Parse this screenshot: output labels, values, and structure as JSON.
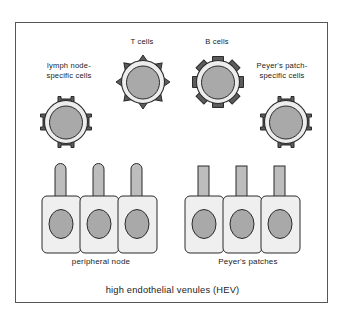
{
  "figure": {
    "title": "high endothelial venules (HEV)",
    "background": "#ffffff",
    "border_color": "#55575a"
  },
  "labels": {
    "t_cells": "T cells",
    "b_cells": "B cells",
    "lymph_node_cells": "lymph node-\nspecific cells",
    "peyers_patch_cells": "Peyer's patch-\nspecific cells",
    "peripheral_node": "peripheral node",
    "peyers_patches": "Peyer's patches",
    "caption": "high endothelial venules (HEV)"
  },
  "palette": {
    "outline": "#2b2b2b",
    "cell_rim": "#ededed",
    "nucleus": "#a9a9a9",
    "receptor_dark": "#5c5c5c",
    "venule_body": "#efefef",
    "venule_nucleus": "#a9a9a9",
    "stalk": "#bdbdbd"
  },
  "cells": [
    {
      "id": "t-cell",
      "label": "T cells",
      "receptor_style": "pointed-spikes",
      "receptor_count": 8,
      "nucleus": "#a9a9a9"
    },
    {
      "id": "b-cell",
      "label": "B cells",
      "receptor_style": "blocky-spikes",
      "receptor_count": 8,
      "nucleus": "#a9a9a9"
    },
    {
      "id": "lymph-node-specific-cell",
      "label": "lymph node-\nspecific cells",
      "receptor_style": "bowtie-homing-receptor",
      "receptor_count": 4,
      "nucleus": "#a9a9a9"
    },
    {
      "id": "peyers-patch-specific-cell",
      "label": "Peyer's patch-\nspecific cells",
      "receptor_style": "ibeam-homing-receptor",
      "receptor_count": 4,
      "nucleus": "#a9a9a9"
    }
  ],
  "venule_groups": [
    {
      "id": "peripheral-node",
      "label": "peripheral node",
      "stalk_top": "rounded",
      "venule_count": 3,
      "docked_cell": "lymph-node-specific-cell"
    },
    {
      "id": "peyers-patches",
      "label": "Peyer's patches",
      "stalk_top": "flat",
      "venule_count": 3,
      "docked_cell": "peyers-patch-specific-cell"
    }
  ]
}
